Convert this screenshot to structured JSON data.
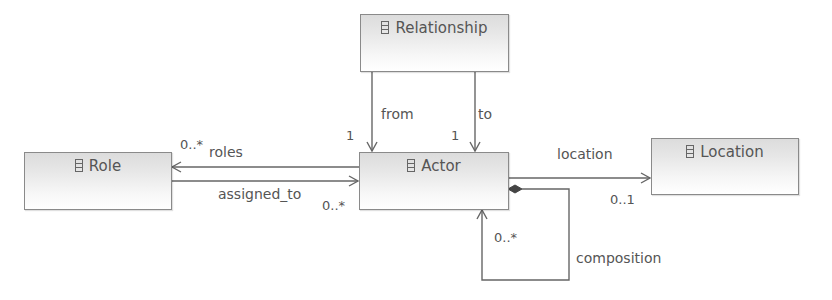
{
  "diagram": {
    "type": "uml-class-diagram",
    "classes": [
      {
        "id": "relationship",
        "name": "Relationship",
        "icon": "class-icon"
      },
      {
        "id": "role",
        "name": "Role",
        "icon": "class-icon"
      },
      {
        "id": "actor",
        "name": "Actor",
        "icon": "class-icon"
      },
      {
        "id": "location",
        "name": "Location",
        "icon": "class-icon"
      }
    ],
    "associations": [
      {
        "id": "from",
        "source": "Relationship",
        "target": "Actor",
        "label": "from",
        "target_multiplicity": "1",
        "kind": "directed"
      },
      {
        "id": "to",
        "source": "Relationship",
        "target": "Actor",
        "label": "to",
        "target_multiplicity": "1",
        "kind": "directed"
      },
      {
        "id": "roles",
        "source": "Actor",
        "target": "Role",
        "label": "roles",
        "target_multiplicity": "0..*",
        "kind": "directed"
      },
      {
        "id": "assigned_to",
        "source": "Role",
        "target": "Actor",
        "label": "assigned_to",
        "target_multiplicity": "0..*",
        "kind": "directed"
      },
      {
        "id": "location",
        "source": "Actor",
        "target": "Location",
        "label": "location",
        "target_multiplicity": "0..1",
        "kind": "directed"
      },
      {
        "id": "composition",
        "source": "Actor",
        "target": "Actor",
        "label": "composition",
        "target_multiplicity": "0..*",
        "kind": "composition"
      }
    ]
  },
  "colors": {
    "line": "#666666",
    "border": "#8a8a8a",
    "text": "#555555"
  }
}
